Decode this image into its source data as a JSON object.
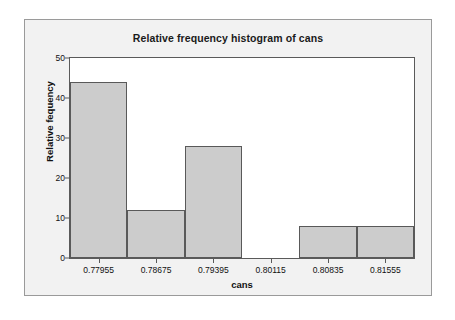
{
  "chart_data": {
    "type": "bar",
    "title": "Relative frequency histogram of cans",
    "xlabel": "cans",
    "ylabel": "Relative fequency",
    "categories": [
      "0.77955",
      "0.78675",
      "0.79395",
      "0.80115",
      "0.80835",
      "0.81555"
    ],
    "values": [
      44,
      12,
      28,
      0,
      8,
      8
    ],
    "ylim": [
      0,
      50
    ],
    "yticks": [
      "0",
      "10",
      "20",
      "30",
      "40",
      "50"
    ],
    "ytick_values": [
      0,
      10,
      20,
      30,
      40,
      50
    ],
    "grid": false,
    "legend": "none",
    "bar_fill_color": "#cccccc",
    "bar_edge_color": "#595959",
    "plot_background": "#ffffff",
    "panel_background": "#f2f2f2"
  }
}
